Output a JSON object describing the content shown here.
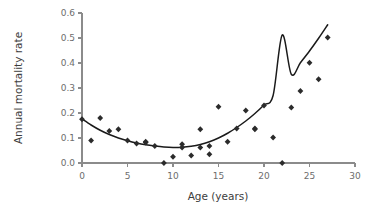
{
  "chart_data": {
    "type": "scatter",
    "title": "",
    "xlabel": "Age (years)",
    "ylabel": "Annual mortality rate",
    "xlim": [
      0,
      30
    ],
    "ylim": [
      0.0,
      0.6
    ],
    "xticks": [
      0,
      5,
      10,
      15,
      20,
      25,
      30
    ],
    "xticklabels": [
      "0",
      "5",
      "10",
      "15",
      "20",
      "25",
      "30"
    ],
    "yticks": [
      0.0,
      0.1,
      0.2,
      0.3,
      0.4,
      0.5,
      0.6
    ],
    "yticklabels": [
      "0.0",
      "0.1",
      "0.2",
      "0.3",
      "0.4",
      "0.5",
      "0.6"
    ],
    "grid": false,
    "legend": false,
    "marker": "diamond",
    "marker_color": "#2b2b2b",
    "curve_color": "#1a1a1a",
    "axis_color": "#8b8b8b",
    "series": [
      {
        "name": "Annual mortality rate",
        "x": [
          0,
          1,
          2,
          3,
          4,
          5,
          6,
          7,
          7,
          8,
          9,
          10,
          11,
          11,
          12,
          13,
          13,
          14,
          14,
          15,
          16,
          17,
          18,
          19,
          19,
          20,
          21,
          22,
          23,
          24,
          25,
          26,
          27
        ],
        "y": [
          0.175,
          0.09,
          0.18,
          0.128,
          0.135,
          0.09,
          0.078,
          0.085,
          0.082,
          0.068,
          0.0,
          0.025,
          0.075,
          0.062,
          0.03,
          0.135,
          0.062,
          0.035,
          0.068,
          0.225,
          0.085,
          0.138,
          0.21,
          0.138,
          0.135,
          0.23,
          0.102,
          0.0,
          0.222,
          0.288,
          0.401,
          0.335,
          0.502
        ]
      }
    ],
    "fit_curve": {
      "name": "quadratic fit",
      "x": [
        0,
        1,
        2,
        3,
        4,
        5,
        6,
        7,
        8,
        9,
        10,
        11,
        12,
        13,
        14,
        15,
        16,
        17,
        18,
        19,
        20,
        21,
        22,
        23,
        24,
        25,
        26,
        27
      ],
      "y": [
        0.176,
        0.152,
        0.131,
        0.114,
        0.1,
        0.089,
        0.08,
        0.073,
        0.068,
        0.064,
        0.062,
        0.063,
        0.067,
        0.074,
        0.085,
        0.1,
        0.119,
        0.142,
        0.168,
        0.198,
        0.232,
        0.27,
        0.512,
        0.355,
        0.401,
        0.448,
        0.499,
        0.553
      ]
    }
  }
}
